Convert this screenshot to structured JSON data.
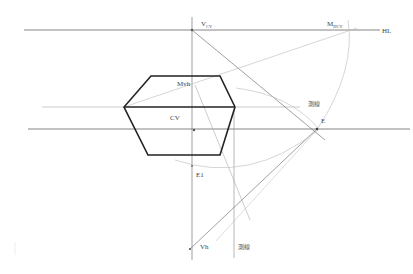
{
  "diagram": {
    "type": "perspective-construction",
    "labels": {
      "vcv": {
        "main": "V",
        "sub": "CV"
      },
      "mhcv": {
        "main": "M",
        "sub": "HCV"
      },
      "hl": "HL",
      "mvh": "Mvh",
      "cv": "CV",
      "e": "E",
      "e1": "E1",
      "vh": "Vh",
      "measure_line_1": "測線",
      "measure_line_2": "測線"
    },
    "colors": {
      "shape_stroke": "#222222",
      "line_dark": "#555555",
      "line_light": "#b5b5b5"
    }
  }
}
